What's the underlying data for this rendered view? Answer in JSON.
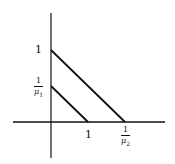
{
  "diagram": {
    "colors": {
      "axis": "#111111",
      "line": "#111111",
      "background": "#ffffff"
    },
    "axes": {
      "x_axis": {
        "y": 122,
        "x_from": 13,
        "x_to": 165
      },
      "y_axis": {
        "x": 51,
        "y_from": 13,
        "y_to": 158
      }
    },
    "lines": [
      {
        "name": "outer-line",
        "from": {
          "x": 51,
          "y": 50
        },
        "to": {
          "x": 125,
          "y": 122
        }
      },
      {
        "name": "inner-line",
        "from": {
          "x": 51,
          "y": 86
        },
        "to": {
          "x": 88,
          "y": 122
        }
      }
    ],
    "labels": {
      "y_one": "1",
      "y_frac_num": "1",
      "y_frac_den": "μ",
      "y_frac_sub": "1",
      "x_one": "1",
      "x_frac_num": "1",
      "x_frac_den": "μ",
      "x_frac_sub": "2"
    }
  }
}
